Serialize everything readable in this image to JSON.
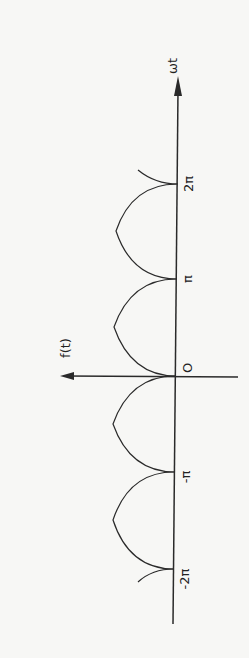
{
  "diagram": {
    "axes": {
      "horizontal_label": "ωt",
      "vertical_label": "f(t)",
      "origin_label": "O"
    },
    "ticks": [
      {
        "value": "2π",
        "y": 184
      },
      {
        "value": "π",
        "y": 279
      },
      {
        "value": "0",
        "y": 376
      },
      {
        "value": "-π",
        "y": 472
      },
      {
        "value": "-2π",
        "y": 569
      }
    ],
    "colors": {
      "line": "#2a2a2a",
      "background": "#f7f7f5"
    }
  }
}
